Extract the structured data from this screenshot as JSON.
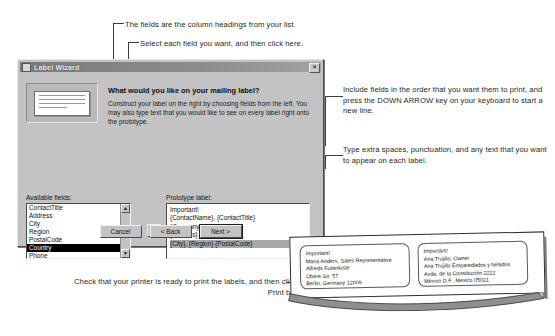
{
  "annotations": {
    "fields_note": "The fields are the column headings from your list.",
    "select_note": "Select each field you want, and then click here.",
    "include_note": "Include fields in the order that you want them to print, and press the DOWN ARROW key on your keyboard to start a new line.",
    "type_note": "Type extra spaces, punctuation, and any text that you want to appear on each label.",
    "print_note": "Check that your printer is ready to print the labels, and then click the Print button."
  },
  "dialog": {
    "title": "Label Wizard",
    "close_label": "✕",
    "heading": "What would you like on your mailing label?",
    "intro": "Construct your label on the right by choosing fields from the left. You may also type text that you would like to see on every label right onto the prototype.",
    "available_fields_label": "Available fields:",
    "prototype_label_label": "Prototype label:",
    "available_fields": [
      {
        "name": "ContactTitle",
        "selected": false
      },
      {
        "name": "Address",
        "selected": false
      },
      {
        "name": "City",
        "selected": false
      },
      {
        "name": "Region",
        "selected": false
      },
      {
        "name": "PostalCode",
        "selected": false
      },
      {
        "name": "Country",
        "selected": true
      },
      {
        "name": "Phone",
        "selected": false
      }
    ],
    "move_button_label": "›",
    "scroll_up_label": "▲",
    "scroll_down_label": "▼",
    "prototype_lines": [
      {
        "text": "Important!",
        "selected": false
      },
      {
        "text": "{ContactName}, {ContactTitle}",
        "selected": false
      },
      {
        "text": "{CompanyName}",
        "selected": false
      },
      {
        "text": "{Address}",
        "selected": false
      },
      {
        "text": "{City}, {Region} {PostalCode}",
        "selected": true
      }
    ],
    "buttons": {
      "cancel": "Cancel",
      "back": "< Back",
      "next": "Next >"
    }
  },
  "printed_sheet": {
    "labels": [
      {
        "lines": [
          "Important!",
          "Maria Anders, Sales Representative",
          "Alfreds Futterkiste",
          "Obere Str. 57",
          "Berlin, Germany  12009"
        ]
      },
      {
        "lines": [
          "Important!",
          "Ana Trujillo, Owner",
          "Ana Trujillo Emparedados y helados",
          "Avda. de la Constitución 2222",
          "México D.F., Mexico  05021"
        ]
      }
    ]
  },
  "colors": {
    "dialog_face": "#c3c3c3",
    "titlebar": "#8c8c8c",
    "selection": "#000000",
    "prototype_selection": "#a8a8a8",
    "page": "#ffffff",
    "ink": "#262626"
  }
}
